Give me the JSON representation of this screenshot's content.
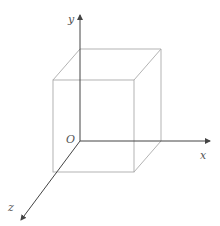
{
  "diagram": {
    "type": "3d-coordinate-cube",
    "axes": {
      "x_label": "x",
      "y_label": "y",
      "z_label": "z",
      "origin_label": "O"
    },
    "colors": {
      "axis": "#444444",
      "cube_edge": "#aaaaaa",
      "label": "#555555"
    }
  }
}
